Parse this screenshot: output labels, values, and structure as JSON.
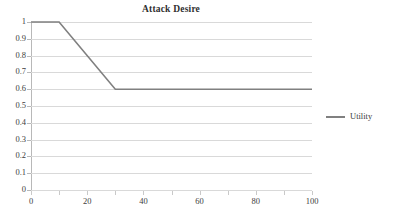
{
  "chart_data": {
    "type": "line",
    "title": "Attack Desire",
    "xlabel": "",
    "ylabel": "",
    "xlim": [
      0,
      100
    ],
    "ylim": [
      0,
      1
    ],
    "grid": true,
    "legend_position": "right",
    "x_ticks": [
      0,
      20,
      40,
      60,
      80,
      100
    ],
    "x_tick_labels": [
      "0",
      "20",
      "40",
      "60",
      "80",
      "100"
    ],
    "x_minor_ticks": [
      0,
      10,
      20,
      30,
      40,
      50,
      60,
      70,
      80,
      90,
      100
    ],
    "y_ticks": [
      0,
      0.1,
      0.2,
      0.3,
      0.4,
      0.5,
      0.6,
      0.7,
      0.8,
      0.9,
      1
    ],
    "y_tick_labels": [
      "0",
      "0.1",
      "0.2",
      "0.3",
      "0.4",
      "0.5",
      "0.6",
      "0.7",
      "0.8",
      "0.9",
      "1"
    ],
    "series": [
      {
        "name": "Utility",
        "color": "#808080",
        "x": [
          0,
          10,
          30,
          100
        ],
        "values": [
          1,
          1,
          0.6,
          0.6
        ]
      }
    ]
  },
  "legend": {
    "entries": [
      {
        "label": "Utility",
        "color": "#808080"
      }
    ]
  },
  "colors": {
    "series_line": "#808080",
    "gridline": "#d9d9d9",
    "axis_line": "#b8b8b8",
    "tick_label": "#404040",
    "title": "#2f2f2f",
    "background": "#ffffff"
  }
}
